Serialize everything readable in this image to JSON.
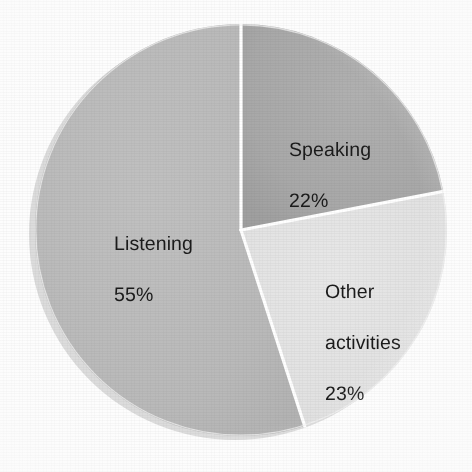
{
  "chart_data": {
    "type": "pie",
    "title": "",
    "subtitle": "",
    "xlabel": "",
    "ylabel": "",
    "legend_position": "none",
    "grid": false,
    "units": "percent",
    "total": 100,
    "start_angle_deg": 0,
    "direction": "clockwise",
    "categories": [
      "Speaking",
      "Other activities",
      "Listening"
    ],
    "values": [
      22,
      23,
      55
    ],
    "slices": [
      {
        "name": "Speaking",
        "label": "Speaking",
        "value": 22,
        "value_label": "22%",
        "color": "#a9a9a9",
        "start_deg": 0,
        "sweep_deg": 79.2
      },
      {
        "name": "Other activities",
        "label": "Other\nactivities",
        "value": 23,
        "value_label": "23%",
        "color": "#e2e2e2",
        "start_deg": 79.2,
        "sweep_deg": 82.8
      },
      {
        "name": "Listening",
        "label": "Listening",
        "value": 55,
        "value_label": "55%",
        "color": "#b9b9b9",
        "start_deg": 162.0,
        "sweep_deg": 198.0
      }
    ]
  },
  "chart": {
    "background_color": "#fdfdfd",
    "separator_color": "#ffffff",
    "shadow_color": "#d6d6d6",
    "label_text_color": "#1b1b1b",
    "center_x": 241,
    "center_y": 230,
    "radius": 206
  },
  "labels": {
    "speaking": {
      "name": "Speaking",
      "value": "22%"
    },
    "listening": {
      "name": "Listening",
      "value": "55%"
    },
    "other": {
      "line1": "Other",
      "line2": "activities",
      "value": "23%"
    }
  }
}
